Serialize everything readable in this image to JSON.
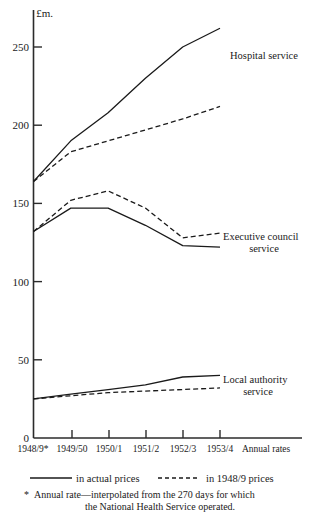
{
  "chart_data": {
    "type": "line",
    "title": "",
    "unit_label": "£m.",
    "xlabel": "",
    "ylabel": "",
    "categories": [
      "1948/9*",
      "1949/50",
      "1950/1",
      "1951/2",
      "1952/3",
      "1953/4"
    ],
    "x_axis_end_label": "Annual rates",
    "ylim": [
      0,
      275
    ],
    "yticks": [
      0,
      50,
      100,
      150,
      200,
      250
    ],
    "ytick_labels": [
      "0",
      "50",
      "100",
      "150",
      "200",
      "250"
    ],
    "grid": false,
    "legend_position": "below-axis",
    "series": [
      {
        "name": "Hospital service — in actual prices",
        "group": "Hospital service",
        "style": "solid",
        "values": [
          164,
          190,
          208,
          230,
          250,
          262
        ]
      },
      {
        "name": "Hospital service — in 1948/9 prices",
        "group": "Hospital service",
        "style": "dashed",
        "values": [
          164,
          183,
          190,
          197,
          204,
          212
        ]
      },
      {
        "name": "Executive council service — in actual prices",
        "group": "Executive council service",
        "style": "solid",
        "values": [
          132,
          147,
          147,
          136,
          123,
          122
        ]
      },
      {
        "name": "Executive council service — in 1948/9 prices",
        "group": "Executive council service",
        "style": "dashed",
        "values": [
          132,
          152,
          158,
          147,
          128,
          131
        ]
      },
      {
        "name": "Local authority service — in actual prices",
        "group": "Local authority service",
        "style": "solid",
        "values": [
          25,
          28,
          31,
          34,
          39,
          40
        ]
      },
      {
        "name": "Local authority service — in 1948/9 prices",
        "group": "Local authority service",
        "style": "dashed",
        "values": [
          25,
          27,
          29,
          30,
          31,
          32
        ]
      }
    ],
    "annotations": [
      {
        "id": "hospital",
        "lines": [
          "Hospital service"
        ],
        "x": 230,
        "y": 59
      },
      {
        "id": "executive-council",
        "lines": [
          "Executive council",
          "service"
        ],
        "x": 223,
        "y": 240
      },
      {
        "id": "local-authority",
        "lines": [
          "Local authority",
          "service"
        ],
        "x": 223,
        "y": 383
      }
    ],
    "legend": [
      {
        "style": "solid",
        "label": "in actual prices"
      },
      {
        "style": "dashed",
        "label": "in 1948/9 prices"
      }
    ],
    "footnote": {
      "marker": "*",
      "line1": "Annual rate—interpolated from the 270 days for which",
      "line2": "the National Health Service operated."
    }
  }
}
